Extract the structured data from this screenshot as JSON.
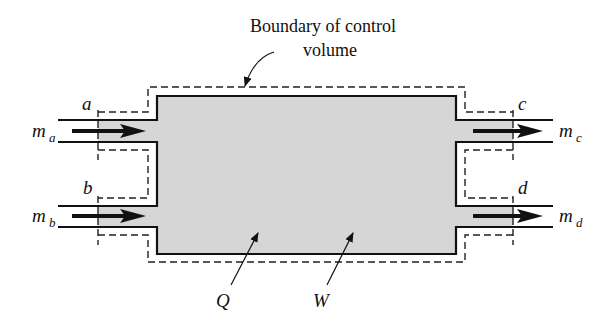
{
  "diagram": {
    "title_line1": "Boundary of control",
    "title_line2": "volume",
    "colors": {
      "fill": "#d6d6d6",
      "stroke": "#111111",
      "boundary": "#222222"
    },
    "inlets": [
      {
        "station": "a",
        "flow": "m",
        "flow_sub": "a"
      },
      {
        "station": "b",
        "flow": "m",
        "flow_sub": "b"
      }
    ],
    "outlets": [
      {
        "station": "c",
        "flow": "m",
        "flow_sub": "c"
      },
      {
        "station": "d",
        "flow": "m",
        "flow_sub": "d"
      }
    ],
    "heat_label": "Q",
    "work_label": "W"
  }
}
